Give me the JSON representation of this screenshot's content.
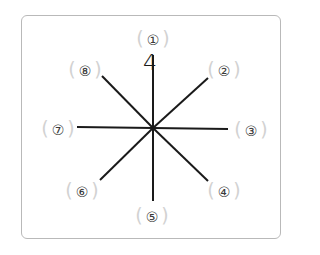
{
  "diagram": {
    "type": "eight-direction-compass",
    "center": {
      "x": 153,
      "y": 128
    },
    "line_color": "#1a1a1a",
    "frame_border_color": "#b9b9b9",
    "paren_color": "#d2d2d2",
    "labels": [
      {
        "id": "1",
        "text": "①",
        "x": 153,
        "y": 38
      },
      {
        "id": "2",
        "text": "②",
        "x": 224,
        "y": 69
      },
      {
        "id": "3",
        "text": "③",
        "x": 251,
        "y": 129
      },
      {
        "id": "4",
        "text": "④",
        "x": 224,
        "y": 190
      },
      {
        "id": "5",
        "text": "⑤",
        "x": 152,
        "y": 215
      },
      {
        "id": "6",
        "text": "⑥",
        "x": 82,
        "y": 190
      },
      {
        "id": "7",
        "text": "⑦",
        "x": 58,
        "y": 128
      },
      {
        "id": "8",
        "text": "⑧",
        "x": 85,
        "y": 69
      }
    ],
    "lines": [
      {
        "name": "north",
        "x2": 153,
        "y2": 55
      },
      {
        "name": "south",
        "x2": 153,
        "y2": 201
      },
      {
        "name": "west",
        "x2": 77,
        "y2": 127
      },
      {
        "name": "east",
        "x2": 228,
        "y2": 129
      },
      {
        "name": "northwest",
        "x2": 102,
        "y2": 76
      },
      {
        "name": "northeast",
        "x2": 208,
        "y2": 78
      },
      {
        "name": "southwest",
        "x2": 100,
        "y2": 180
      },
      {
        "name": "southeast",
        "x2": 208,
        "y2": 181
      }
    ],
    "answer": {
      "text": "4",
      "x": 150,
      "y": 63
    }
  }
}
